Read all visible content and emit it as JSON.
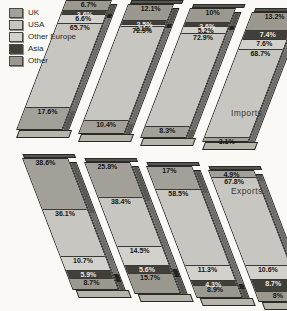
{
  "chart_data": {
    "type": "bar",
    "variant": "3d-stacked-percentage-columns",
    "title": "",
    "legend": [
      "UK",
      "USA",
      "Other Europe",
      "Asia",
      "Other"
    ],
    "colors": {
      "UK": "#a3a09a",
      "USA": "#c8c6c0",
      "Other Europe": "#d3d1cb",
      "Asia": "#413f3a",
      "Other": "#9b9890",
      "outline": "#2a2a27"
    },
    "rows": [
      {
        "name": "Imports",
        "lean": "right",
        "bars": [
          {
            "segments": [
              {
                "category": "Other",
                "value": 6.7,
                "label": "6.7%"
              },
              {
                "category": "Asia",
                "value": 3.6,
                "label": "3.6%"
              },
              {
                "category": "Other Europe",
                "value": 6.6,
                "label": "6.6%"
              },
              {
                "category": "USA",
                "value": 65.7,
                "label": "65.7%"
              },
              {
                "category": "UK",
                "value": 17.6,
                "label": "17.6%"
              }
            ]
          },
          {
            "segments": [
              {
                "category": "Other",
                "value": 12.1,
                "label": "12.1%"
              },
              {
                "category": "Asia",
                "value": 2.5,
                "label": "2.5%"
              },
              {
                "category": "Other Europe",
                "value": 2.1,
                "label": "2.1%"
              },
              {
                "category": "USA",
                "value": 72.9,
                "label": "72.9%"
              },
              {
                "category": "UK",
                "value": 10.4,
                "label": "10.4%"
              }
            ]
          },
          {
            "segments": [
              {
                "category": "Other",
                "value": 10.0,
                "label": "10%"
              },
              {
                "category": "Asia",
                "value": 3.6,
                "label": "3.6%"
              },
              {
                "category": "Other Europe",
                "value": 5.2,
                "label": "5.2%"
              },
              {
                "category": "USA",
                "value": 72.9,
                "label": "72.9%"
              },
              {
                "category": "UK",
                "value": 8.3,
                "label": "8.3%"
              }
            ]
          },
          {
            "segments": [
              {
                "category": "Other",
                "value": 13.2,
                "label": "13.2%"
              },
              {
                "category": "Asia",
                "value": 7.4,
                "label": "7.4%"
              },
              {
                "category": "Other Europe",
                "value": 7.6,
                "label": "7.6%"
              },
              {
                "category": "USA",
                "value": 68.7,
                "label": "68.7%"
              },
              {
                "category": "UK",
                "value": 3.1,
                "label": "3.1%"
              }
            ]
          }
        ]
      },
      {
        "name": "Exports",
        "lean": "left",
        "bars": [
          {
            "segments": [
              {
                "category": "UK",
                "value": 38.6,
                "label": "38.6%"
              },
              {
                "category": "USA",
                "value": 36.1,
                "label": "36.1%"
              },
              {
                "category": "Other Europe",
                "value": 10.7,
                "label": "10.7%"
              },
              {
                "category": "Asia",
                "value": 5.9,
                "label": "5.9%"
              },
              {
                "category": "Other",
                "value": 8.7,
                "label": "8.7%"
              }
            ]
          },
          {
            "segments": [
              {
                "category": "UK",
                "value": 25.8,
                "label": "25.8%"
              },
              {
                "category": "USA",
                "value": 38.4,
                "label": "38.4%"
              },
              {
                "category": "Other Europe",
                "value": 14.5,
                "label": "14.5%"
              },
              {
                "category": "Asia",
                "value": 5.6,
                "label": "5.6%"
              },
              {
                "category": "Other",
                "value": 15.7,
                "label": "15.7%"
              }
            ]
          },
          {
            "segments": [
              {
                "category": "UK",
                "value": 17.0,
                "label": "17%"
              },
              {
                "category": "USA",
                "value": 58.5,
                "label": "58.5%"
              },
              {
                "category": "Other Europe",
                "value": 11.3,
                "label": "11.3%"
              },
              {
                "category": "Asia",
                "value": 4.3,
                "label": "4.3%"
              },
              {
                "category": "Other",
                "value": 8.9,
                "label": "8.9%"
              }
            ]
          },
          {
            "segments": [
              {
                "category": "UK",
                "value": 4.9,
                "label": "4.9%"
              },
              {
                "category": "USA",
                "value": 67.8,
                "label": "67.8%"
              },
              {
                "category": "Other Europe",
                "value": 10.6,
                "label": "10.6%"
              },
              {
                "category": "Asia",
                "value": 8.7,
                "label": "8.7%"
              },
              {
                "category": "Other",
                "value": 8.0,
                "label": "8%"
              }
            ]
          }
        ]
      }
    ]
  }
}
